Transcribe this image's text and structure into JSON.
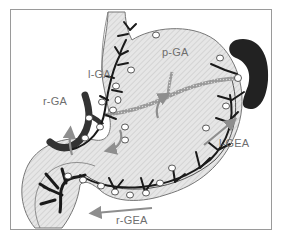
{
  "diagram": {
    "colors": {
      "frame": "#9a9a9a",
      "stomach_fill": "#e2e2e2",
      "stomach_outline": "#777777",
      "artery": "#1a1a1a",
      "spleen": "#222222",
      "lymph_node": "#ffffff",
      "arrow": "#8e8e8e",
      "label": "#6e6e6e",
      "portal_vessel": "#8a8a8a"
    },
    "labels": {
      "lga": "l-GA",
      "rga": "r-GA",
      "pga": "p-GA",
      "lgea": "l-GEA",
      "rgea": "r-GEA"
    },
    "arrows": [
      {
        "name": "r-GA",
        "direction": "up"
      },
      {
        "name": "l-GEA",
        "direction": "up-right"
      },
      {
        "name": "r-GEA",
        "direction": "left"
      },
      {
        "name": "p-GA",
        "direction": "down"
      }
    ],
    "structures": [
      "stomach",
      "esophagus",
      "duodenum",
      "spleen",
      "lymph-nodes",
      "gastric-arteries"
    ]
  }
}
